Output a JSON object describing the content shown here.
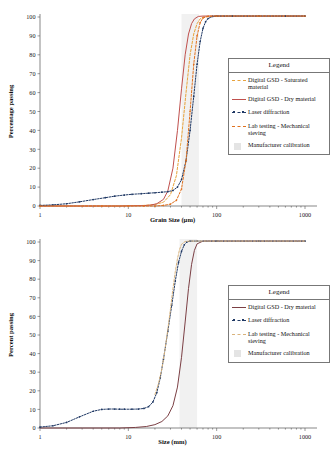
{
  "chart_data": [
    {
      "id": "top",
      "type": "line",
      "title": "",
      "xlabel": "Grain Size (µm)",
      "ylabel": "Percentage passing",
      "xscale": "log",
      "xlim": [
        1,
        1000
      ],
      "ylim": [
        0,
        100
      ],
      "xticks": [
        1,
        10,
        100,
        1000
      ],
      "xtick_labels": [
        "1",
        "10",
        "100",
        "1000"
      ],
      "yticks": [
        0,
        10,
        20,
        30,
        40,
        50,
        60,
        70,
        80,
        90,
        100
      ],
      "ytick_labels": [
        "0",
        "10",
        "20",
        "30",
        "40",
        "50",
        "60",
        "70",
        "80",
        "90",
        "100"
      ],
      "grid": false,
      "legend_position": "right",
      "calibration_band": {
        "x_start": 40,
        "x_end": 63,
        "label": "Manufacturer calibration",
        "color": "#e8e8e8"
      },
      "series": [
        {
          "name": "Digital GSD - Saturated material",
          "color": "#e8a33d",
          "style": "dashed",
          "x": [
            1,
            3,
            8,
            15,
            20,
            25,
            30,
            35,
            40,
            45,
            50,
            55,
            60,
            65,
            70,
            80,
            100,
            200,
            400,
            1000
          ],
          "y": [
            0,
            0,
            0,
            0.3,
            0.8,
            2,
            6,
            16,
            36,
            60,
            80,
            91,
            96.5,
            99,
            100,
            100.5,
            100.5,
            100.5,
            100.5,
            100.5
          ]
        },
        {
          "name": "Digital GSD - Dry material",
          "color": "#c0504d",
          "style": "solid",
          "x": [
            1,
            3,
            8,
            15,
            18,
            21,
            25,
            28,
            32,
            36,
            40,
            44,
            48,
            52,
            56,
            62,
            70,
            100,
            200,
            400,
            1000
          ],
          "y": [
            0,
            0,
            0,
            0.2,
            0.5,
            1.2,
            3.5,
            8,
            20,
            40,
            62,
            80,
            91,
            96.5,
            99,
            100.3,
            100.5,
            100.5,
            100.5,
            100.5,
            100.5
          ]
        },
        {
          "name": "Laser diffraction",
          "color": "#1f3864",
          "style": "dash-dot-markers",
          "x": [
            1,
            1.4,
            2,
            2.8,
            4,
            5.5,
            7,
            9,
            11,
            14,
            17,
            20,
            24,
            28,
            32,
            36,
            40,
            45,
            50,
            55,
            60,
            65,
            70,
            75,
            80,
            90,
            100,
            150,
            300,
            600,
            1000
          ],
          "y": [
            0.3,
            0.6,
            1.2,
            2.2,
            3.4,
            4.4,
            5.2,
            5.8,
            6.2,
            6.5,
            6.8,
            7.0,
            7.3,
            7.6,
            8.2,
            10,
            14,
            24,
            40,
            58,
            75,
            87,
            94,
            97.5,
            99.2,
            100.3,
            100.5,
            100.5,
            100.5,
            100.5,
            100.5
          ]
        },
        {
          "name": "Lab testing - Mechanical sieving",
          "color": "#e0711f",
          "style": "dashed-markers",
          "x": [
            1,
            5,
            10,
            15,
            20,
            25,
            30,
            35,
            40,
            45,
            50,
            55,
            60,
            65,
            70,
            80,
            100,
            300,
            1000
          ],
          "y": [
            0,
            0,
            0,
            0,
            0,
            0.3,
            1,
            3,
            9,
            24,
            50,
            75,
            90,
            97,
            99.5,
            100.3,
            100.5,
            100.5,
            100.5
          ]
        }
      ]
    },
    {
      "id": "bottom",
      "type": "line",
      "title": "",
      "xlabel": "Size (mm)",
      "ylabel": "Percent passing",
      "xscale": "log",
      "xlim": [
        1,
        1000
      ],
      "ylim": [
        0,
        100
      ],
      "xticks": [
        1,
        10,
        100,
        1000
      ],
      "xtick_labels": [
        "1",
        "10",
        "100",
        "1000"
      ],
      "yticks": [
        0,
        10,
        20,
        30,
        40,
        50,
        60,
        70,
        80,
        90,
        100
      ],
      "ytick_labels": [
        "0",
        "10",
        "20",
        "30",
        "40",
        "50",
        "60",
        "70",
        "80",
        "90",
        "100"
      ],
      "grid": false,
      "legend_position": "right",
      "calibration_band": {
        "x_start": 38,
        "x_end": 60,
        "label": "Manufacturer calibration",
        "color": "#e8e8e8"
      },
      "series": [
        {
          "name": "Digital GSD - Dry material",
          "color": "#7b3f44",
          "style": "solid",
          "x": [
            1,
            3,
            8,
            12,
            16,
            20,
            24,
            28,
            32,
            36,
            40,
            44,
            48,
            52,
            56,
            60,
            70,
            100,
            300,
            1000
          ],
          "y": [
            0,
            0,
            0,
            0.3,
            0.8,
            1.8,
            3.5,
            6.5,
            12,
            22,
            38,
            57,
            75,
            88,
            95.5,
            99,
            100.5,
            100.5,
            100.5,
            100.5
          ]
        },
        {
          "name": "Laser diffraction",
          "color": "#1f3864",
          "style": "dash-dot-markers",
          "x": [
            1,
            1.4,
            2,
            2.8,
            4,
            5,
            6,
            7,
            8,
            9,
            11,
            13,
            15,
            17,
            19,
            21,
            23,
            25,
            28,
            31,
            34,
            37,
            40,
            43,
            46,
            50,
            60,
            100,
            300,
            1000
          ],
          "y": [
            0.5,
            1.2,
            3,
            6,
            9,
            10,
            10.2,
            10.2,
            10.1,
            10.1,
            10.1,
            10.2,
            10.5,
            11.5,
            14,
            19,
            27,
            37,
            52,
            66,
            79,
            89,
            95,
            98.5,
            100,
            100.5,
            100.5,
            100.5,
            100.5,
            100.5
          ]
        },
        {
          "name": "Lab testing - Mechanical sieving",
          "color": "#d9b37c",
          "style": "dashed",
          "x": [
            20,
            22,
            24,
            26,
            28,
            30,
            32,
            34,
            36,
            38,
            40,
            44,
            50,
            60,
            100,
            300,
            1000
          ],
          "y": [
            18,
            24,
            32,
            42,
            53,
            64,
            75,
            84,
            91,
            96,
            98.8,
            100.3,
            100.5,
            100.5,
            100.5,
            100.5,
            100.5
          ]
        }
      ]
    }
  ],
  "charts": {
    "top": {
      "xlabel": "Grain Size (µm)",
      "ylabel": "Percentage passing",
      "xtick_labels": [
        "1",
        "10",
        "100",
        "1000"
      ],
      "ytick_labels": [
        "100",
        "90",
        "80",
        "70",
        "60",
        "50",
        "40",
        "30",
        "20",
        "10",
        "0"
      ],
      "legend": {
        "title": "Legend",
        "items": [
          {
            "label": "Digital GSD - Saturated material",
            "color": "#e8a33d",
            "style": "dashed"
          },
          {
            "label": "Digital GSD - Dry material",
            "color": "#c0504d",
            "style": "solid"
          },
          {
            "label": "Laser diffraction",
            "color": "#1f3864",
            "style": "dash-dot-markers"
          },
          {
            "label": "Lab testing - Mechanical sieving",
            "color": "#e0711f",
            "style": "dashed"
          },
          {
            "label": "Manufacturer calibration",
            "color": "#e4e4e4",
            "style": "swatch"
          }
        ]
      }
    },
    "bottom": {
      "xlabel": "Size (mm)",
      "ylabel": "Percent passing",
      "xtick_labels": [
        "1",
        "10",
        "100",
        "1000"
      ],
      "ytick_labels": [
        "100",
        "90",
        "80",
        "70",
        "60",
        "50",
        "40",
        "30",
        "20",
        "10",
        "0"
      ],
      "legend": {
        "title": "Legend",
        "items": [
          {
            "label": "Digital GSD - Dry material",
            "color": "#7b3f44",
            "style": "solid"
          },
          {
            "label": "Laser diffraction",
            "color": "#1f3864",
            "style": "dash-dot-markers"
          },
          {
            "label": "Lab testing - Mechanical sieving",
            "color": "#d9b37c",
            "style": "dashed"
          },
          {
            "label": "Manufacturer calibration",
            "color": "#e4e4e4",
            "style": "swatch"
          }
        ]
      }
    }
  }
}
